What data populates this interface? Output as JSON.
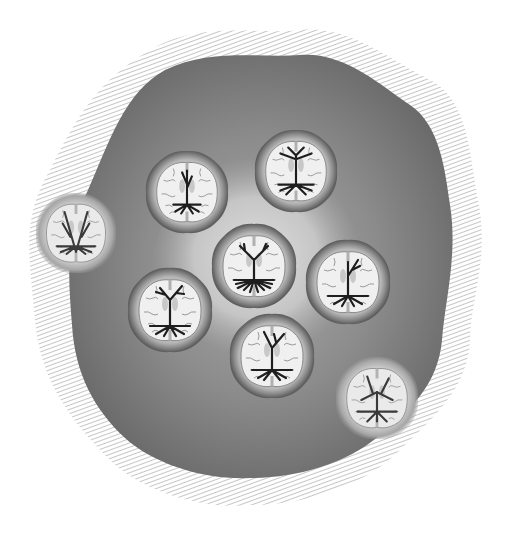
{
  "illustration": {
    "title": "",
    "background_color": "#ffffff",
    "blob": {
      "fill_outer": "#6e6e6e",
      "fill_mid": "#8a8a8a",
      "glow_color": "#d8d8d8",
      "hatch_color": "#9a9a9a"
    },
    "brain_slices": [
      {
        "id": 1,
        "cx": 187,
        "cy": 192,
        "r": 41,
        "faded": false,
        "tree": "narrow-vertical"
      },
      {
        "id": 2,
        "cx": 296,
        "cy": 171,
        "r": 41,
        "faded": false,
        "tree": "split-top"
      },
      {
        "id": 3,
        "cx": 76,
        "cy": 233,
        "r": 40,
        "faded": true,
        "tree": "v-shape"
      },
      {
        "id": 4,
        "cx": 254,
        "cy": 266,
        "r": 42,
        "faded": false,
        "tree": "y-shape-dense-roots"
      },
      {
        "id": 5,
        "cx": 348,
        "cy": 282,
        "r": 42,
        "faded": false,
        "tree": "right-branch"
      },
      {
        "id": 6,
        "cx": 170,
        "cy": 310,
        "r": 42,
        "faded": false,
        "tree": "branching"
      },
      {
        "id": 7,
        "cx": 272,
        "cy": 356,
        "r": 42,
        "faded": false,
        "tree": "y-shape"
      },
      {
        "id": 8,
        "cx": 377,
        "cy": 398,
        "r": 41,
        "faded": true,
        "tree": "wide-spread"
      }
    ]
  }
}
